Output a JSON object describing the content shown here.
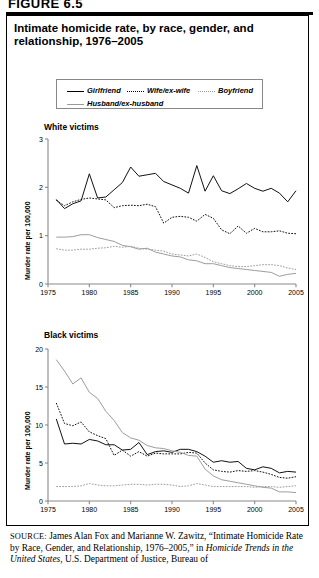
{
  "figure": {
    "label": "FIGURE 6.5"
  },
  "title": "Intimate homicide rate, by race, gender, and relationship, 1976–2005",
  "legend": {
    "items": [
      {
        "label": "Girlfriend",
        "style": "solid-black"
      },
      {
        "label": "Wife/ex-wife",
        "style": "dotted-black"
      },
      {
        "label": "Boyfriend",
        "style": "dotted-gray"
      },
      {
        "label": "Husband/ex-husband",
        "style": "solid-gray"
      }
    ]
  },
  "panels": [
    {
      "heading": "White victims",
      "ylabel": "Murder rate per 100,000"
    },
    {
      "heading": "Black victims",
      "ylabel": "Murder rate per 100,000"
    }
  ],
  "source": {
    "prefix": "SOURCE:",
    "text_1": " James Alan Fox and Marianne W. Zawitz, “Intimate Homicide Rate by Race, Gender, and Relationship, 1976–2005,” in ",
    "italic_1": "Homicide Trends in the United States",
    "text_2": ", U.S. Department of Justice, Bureau of"
  },
  "chart_data": [
    {
      "type": "line",
      "title": "White victims",
      "xlabel": "",
      "ylabel": "Murder rate per 100,000",
      "xlim": [
        1975,
        2005
      ],
      "ylim": [
        0,
        3
      ],
      "xticks": [
        1975,
        1980,
        1985,
        1990,
        1995,
        2000,
        2005
      ],
      "yticks": [
        0,
        1,
        2,
        3
      ],
      "grid": false,
      "legend_position": "above-figure",
      "x": [
        1976,
        1977,
        1978,
        1979,
        1980,
        1981,
        1982,
        1983,
        1984,
        1985,
        1986,
        1987,
        1988,
        1989,
        1990,
        1991,
        1992,
        1993,
        1994,
        1995,
        1996,
        1997,
        1998,
        1999,
        2000,
        2001,
        2002,
        2003,
        2004,
        2005
      ],
      "series": [
        {
          "name": "Girlfriend",
          "style": "solid-black",
          "values": [
            1.75,
            1.56,
            1.66,
            1.72,
            2.28,
            1.78,
            1.8,
            1.95,
            2.1,
            2.42,
            2.23,
            2.26,
            2.29,
            2.12,
            2.05,
            1.98,
            1.88,
            2.45,
            1.92,
            2.24,
            1.93,
            1.87,
            1.97,
            2.08,
            1.98,
            1.92,
            1.98,
            1.88,
            1.7,
            1.93
          ]
        },
        {
          "name": "Wife/ex-wife",
          "style": "dotted-black",
          "values": [
            1.73,
            1.62,
            1.7,
            1.75,
            1.78,
            1.76,
            1.74,
            1.58,
            1.62,
            1.63,
            1.62,
            1.65,
            1.6,
            1.26,
            1.38,
            1.4,
            1.38,
            1.3,
            1.44,
            1.36,
            1.12,
            1.04,
            1.2,
            1.05,
            1.15,
            1.08,
            1.08,
            1.1,
            1.05,
            1.04
          ]
        },
        {
          "name": "Boyfriend",
          "style": "dotted-gray",
          "values": [
            0.73,
            0.7,
            0.7,
            0.72,
            0.72,
            0.74,
            0.75,
            0.78,
            0.76,
            0.78,
            0.74,
            0.72,
            0.7,
            0.68,
            0.62,
            0.6,
            0.58,
            0.62,
            0.55,
            0.46,
            0.42,
            0.38,
            0.36,
            0.36,
            0.38,
            0.4,
            0.4,
            0.38,
            0.33,
            0.3
          ]
        },
        {
          "name": "Husband/ex-husband",
          "style": "solid-gray",
          "values": [
            0.97,
            0.97,
            0.98,
            1.02,
            1.02,
            0.96,
            0.92,
            0.88,
            0.8,
            0.77,
            0.72,
            0.74,
            0.66,
            0.62,
            0.58,
            0.56,
            0.5,
            0.48,
            0.42,
            0.42,
            0.38,
            0.34,
            0.32,
            0.3,
            0.28,
            0.26,
            0.24,
            0.16,
            0.2,
            0.22
          ]
        }
      ]
    },
    {
      "type": "line",
      "title": "Black victims",
      "xlabel": "",
      "ylabel": "Murder rate per 100,000",
      "xlim": [
        1975,
        2005
      ],
      "ylim": [
        0,
        20
      ],
      "xticks": [
        1975,
        1980,
        1985,
        1990,
        1995,
        2000,
        2005
      ],
      "yticks": [
        0,
        5,
        10,
        15,
        20
      ],
      "grid": false,
      "legend_position": "above-figure",
      "x": [
        1976,
        1977,
        1978,
        1979,
        1980,
        1981,
        1982,
        1983,
        1984,
        1985,
        1986,
        1987,
        1988,
        1989,
        1990,
        1991,
        1992,
        1993,
        1994,
        1995,
        1996,
        1997,
        1998,
        1999,
        2000,
        2001,
        2002,
        2003,
        2004,
        2005
      ],
      "series": [
        {
          "name": "Girlfriend",
          "style": "solid-black",
          "values": [
            10.8,
            7.5,
            7.6,
            7.5,
            8.1,
            7.9,
            7.4,
            7.4,
            6.7,
            6.8,
            7.7,
            6.1,
            6.5,
            6.6,
            6.4,
            6.8,
            6.8,
            6.5,
            5.9,
            5.1,
            5.3,
            5.1,
            5.2,
            4.3,
            4.1,
            4.5,
            4.3,
            3.7,
            3.9,
            3.8
          ]
        },
        {
          "name": "Wife/ex-wife",
          "style": "dotted-black",
          "values": [
            12.9,
            10.2,
            9.9,
            10.4,
            9.1,
            8.6,
            8.2,
            6.0,
            6.7,
            5.9,
            6.5,
            5.9,
            6.3,
            6.2,
            6.2,
            6.2,
            6.4,
            6.3,
            5.0,
            4.1,
            3.9,
            3.8,
            4.0,
            3.9,
            4.0,
            3.8,
            3.5,
            3.1,
            3.0,
            3.2
          ]
        },
        {
          "name": "Boyfriend",
          "style": "dotted-gray",
          "values": [
            1.9,
            1.9,
            1.9,
            2.0,
            2.3,
            2.1,
            2.0,
            2.0,
            2.1,
            2.2,
            2.2,
            2.1,
            2.2,
            2.2,
            2.1,
            1.9,
            2.0,
            2.3,
            2.1,
            1.9,
            1.9,
            1.9,
            1.9,
            1.9,
            1.8,
            1.9,
            1.9,
            1.8,
            1.9,
            2.0
          ]
        },
        {
          "name": "Husband/ex-husband",
          "style": "solid-gray",
          "values": [
            18.6,
            17.1,
            15.4,
            16.2,
            14.3,
            13.5,
            11.8,
            10.6,
            9.0,
            8.3,
            8.0,
            7.3,
            7.0,
            6.9,
            6.6,
            6.4,
            6.0,
            5.9,
            4.2,
            3.3,
            2.8,
            2.6,
            2.4,
            2.2,
            2.0,
            1.8,
            1.7,
            1.2,
            1.2,
            1.1
          ]
        }
      ]
    }
  ]
}
